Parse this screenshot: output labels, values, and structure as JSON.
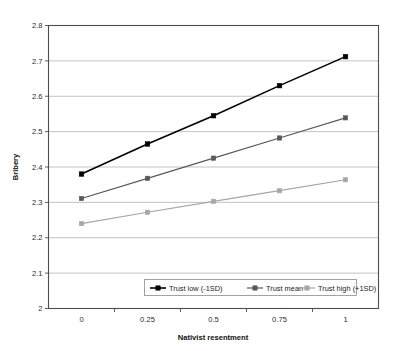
{
  "chart_data": {
    "type": "line",
    "title": "",
    "xlabel": "Nativist resentment",
    "ylabel": "Bribery",
    "x": [
      0,
      0.25,
      0.5,
      0.75,
      1
    ],
    "xtick_labels": [
      "0",
      "0.25",
      "0.5",
      "0.75",
      "1"
    ],
    "ytick_labels": [
      "2",
      "2.1",
      "2.2",
      "2.3",
      "2.4",
      "2.5",
      "2.6",
      "2.7",
      "2.8"
    ],
    "ylim": [
      2,
      2.8
    ],
    "xlim": [
      -0.125,
      1.125
    ],
    "grid": "horizontal",
    "legend_position": "inside-bottom-center",
    "series": [
      {
        "name": "Trust low (-1SD)",
        "values": [
          2.38,
          2.465,
          2.545,
          2.63,
          2.712
        ],
        "color": "#000000",
        "marker": "square"
      },
      {
        "name": "Trust mean",
        "values": [
          2.311,
          2.368,
          2.425,
          2.482,
          2.539
        ],
        "color": "#595959",
        "marker": "square"
      },
      {
        "name": "Trust high (+1SD)",
        "values": [
          2.24,
          2.272,
          2.303,
          2.333,
          2.364
        ],
        "color": "#a6a6a6",
        "marker": "square"
      }
    ]
  },
  "legend": {
    "entries": [
      {
        "label": "Trust low (-1SD)"
      },
      {
        "label": "Trust mean"
      },
      {
        "label": "Trust high (+1SD)"
      }
    ]
  },
  "axes": {
    "y_title": "Bribery",
    "x_title": "Nativist resentment"
  },
  "colors": {
    "series_low": "#000000",
    "series_mean": "#595959",
    "series_high": "#a6a6a6",
    "grid": "#b4b4b4",
    "frame": "#4d4d4d",
    "background": "#ffffff"
  }
}
